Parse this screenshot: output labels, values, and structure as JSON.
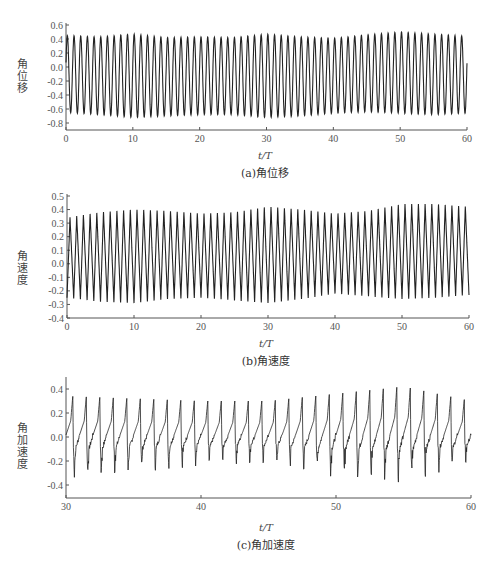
{
  "chart_data": [
    {
      "type": "line",
      "caption": "(a)角位移",
      "title": "",
      "xlabel": "t/T",
      "ylabel": "角位移",
      "xlim": [
        0,
        60
      ],
      "ylim": [
        -0.85,
        0.6
      ],
      "xticks": [
        0,
        10,
        20,
        30,
        40,
        50,
        60
      ],
      "yticks": [
        0.6,
        0.4,
        0.2,
        0.0,
        -0.2,
        -0.4,
        -0.6,
        -0.8
      ],
      "ytick_labels": [
        "0.6",
        "0.4",
        "0.2",
        "0.0",
        "-0.2",
        "-0.4",
        "-0.6",
        "-0.8"
      ],
      "grid": false,
      "legend": null,
      "series": [
        {
          "name": "角位移",
          "waveform": "sine",
          "period": 1.0,
          "x_start": 0,
          "x_end": 60,
          "envelope_t": [
            0,
            5,
            10,
            15,
            20,
            25,
            30,
            35,
            40,
            45,
            50,
            55,
            60
          ],
          "peak": [
            0.45,
            0.43,
            0.47,
            0.42,
            0.43,
            0.42,
            0.47,
            0.43,
            0.41,
            0.46,
            0.5,
            0.47,
            0.44
          ],
          "trough": [
            -0.65,
            -0.68,
            -0.72,
            -0.7,
            -0.68,
            -0.68,
            -0.72,
            -0.7,
            -0.66,
            -0.64,
            -0.66,
            -0.68,
            -0.66
          ]
        }
      ]
    },
    {
      "type": "line",
      "caption": "(b)角速度",
      "title": "",
      "xlabel": "t/T",
      "ylabel": "角速度",
      "xlim": [
        0,
        60
      ],
      "ylim": [
        -0.4,
        0.5
      ],
      "xticks": [
        0,
        10,
        20,
        30,
        40,
        50,
        60
      ],
      "yticks": [
        0.5,
        0.4,
        0.3,
        0.2,
        0.1,
        0.0,
        -0.1,
        -0.2,
        -0.3,
        -0.4
      ],
      "ytick_labels": [
        "0.5",
        "0.4",
        "0.3",
        "0.2",
        "0.1",
        "0.0",
        "-0.1",
        "-0.2",
        "-0.3",
        "-0.4"
      ],
      "grid": false,
      "legend": null,
      "series": [
        {
          "name": "角速度",
          "waveform": "sawtooth-sine",
          "period": 1.0,
          "x_start": 0,
          "x_end": 60,
          "envelope_t": [
            0,
            5,
            10,
            15,
            20,
            25,
            30,
            35,
            40,
            45,
            50,
            55,
            60
          ],
          "peak": [
            0.34,
            0.38,
            0.4,
            0.39,
            0.37,
            0.38,
            0.42,
            0.4,
            0.37,
            0.39,
            0.44,
            0.44,
            0.42
          ],
          "trough": [
            -0.25,
            -0.28,
            -0.29,
            -0.26,
            -0.25,
            -0.27,
            -0.29,
            -0.26,
            -0.22,
            -0.24,
            -0.26,
            -0.25,
            -0.23
          ]
        }
      ]
    },
    {
      "type": "line",
      "caption": "(c)角加速度",
      "title": "",
      "xlabel": "t/T",
      "ylabel": "角加速度",
      "xlim": [
        30,
        60
      ],
      "ylim": [
        -0.5,
        0.5
      ],
      "xticks": [
        30,
        40,
        50,
        60
      ],
      "yticks": [
        0.4,
        0.2,
        0.0,
        -0.2,
        -0.4
      ],
      "ytick_labels": [
        "0.4",
        "0.2",
        "0.0",
        "-0.2",
        "-0.4"
      ],
      "grid": false,
      "legend": null,
      "series": [
        {
          "name": "角加速度",
          "waveform": "spiky-periodic",
          "period": 1.0,
          "x_start": 30,
          "x_end": 60,
          "envelope_t": [
            30,
            35,
            40,
            45,
            50,
            55,
            60
          ],
          "peak": [
            0.34,
            0.32,
            0.3,
            0.3,
            0.36,
            0.42,
            0.3
          ],
          "trough": [
            -0.3,
            -0.25,
            -0.2,
            -0.18,
            -0.28,
            -0.32,
            -0.18
          ]
        }
      ]
    }
  ]
}
